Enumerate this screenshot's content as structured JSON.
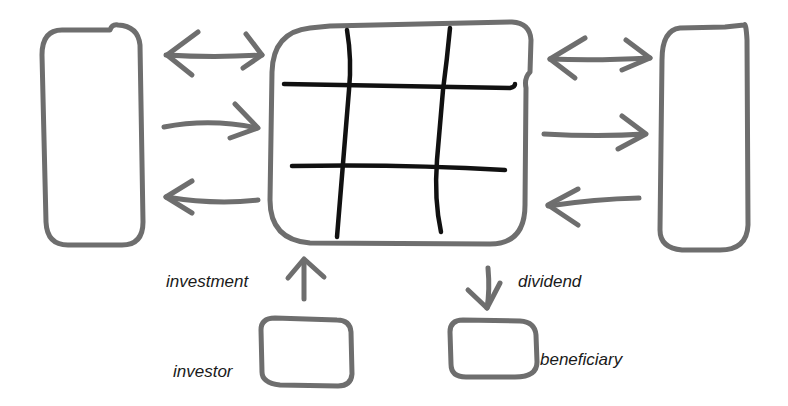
{
  "colors": {
    "background": "#ffffff",
    "outline_stroke": "#6e6e6e",
    "grid_stroke": "#111111",
    "label_text": "#1a1a1a"
  },
  "diagram": {
    "nodes": [
      {
        "id": "left-party",
        "shape": "rounded-rect",
        "label": ""
      },
      {
        "id": "center-hub",
        "shape": "rounded-rect-with-grid",
        "label": "",
        "grid": "3x3 hash"
      },
      {
        "id": "right-party",
        "shape": "rounded-rect",
        "label": ""
      },
      {
        "id": "investor",
        "shape": "rounded-rect",
        "label": "investor"
      },
      {
        "id": "beneficiary",
        "shape": "rounded-rect",
        "label": "beneficiary"
      }
    ],
    "edges": [
      {
        "from": "left-party",
        "to": "center-hub",
        "type": "bidirectional",
        "label": ""
      },
      {
        "from": "left-party",
        "to": "center-hub",
        "type": "arrow",
        "label": ""
      },
      {
        "from": "center-hub",
        "to": "left-party",
        "type": "arrow",
        "label": ""
      },
      {
        "from": "center-hub",
        "to": "right-party",
        "type": "bidirectional",
        "label": ""
      },
      {
        "from": "center-hub",
        "to": "right-party",
        "type": "arrow",
        "label": ""
      },
      {
        "from": "right-party",
        "to": "center-hub",
        "type": "arrow",
        "label": ""
      },
      {
        "from": "investor",
        "to": "center-hub",
        "type": "arrow",
        "label": "investment"
      },
      {
        "from": "center-hub",
        "to": "beneficiary",
        "type": "arrow",
        "label": "dividend"
      }
    ]
  },
  "labels": {
    "investment": "investment",
    "dividend": "dividend",
    "investor": "investor",
    "beneficiary": "beneficiary"
  }
}
